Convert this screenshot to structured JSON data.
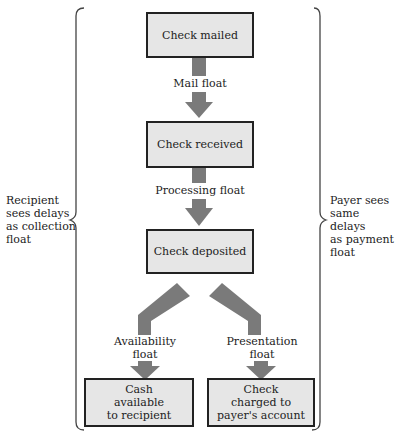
{
  "diagram": {
    "boxes": {
      "mailed": "Check mailed",
      "received": "Check received",
      "deposited": "Check deposited",
      "cash_line1": "Cash",
      "cash_line2": "available",
      "cash_line3": "to recipient",
      "charged_line1": "Check",
      "charged_line2": "charged to",
      "charged_line3": "payer's account"
    },
    "floats": {
      "mail": "Mail float",
      "processing": "Processing float",
      "availability_line1": "Availability",
      "availability_line2": "float",
      "presentation_line1": "Presentation",
      "presentation_line2": "float"
    },
    "sides": {
      "left": [
        "Recipient",
        "sees delays",
        "as collection",
        "float"
      ],
      "right": [
        "Payer sees",
        "same delays",
        "as payment",
        "float"
      ]
    },
    "colors": {
      "box_fill": "#e6e6e6",
      "arrow": "#7a7a7a",
      "border": "#222222"
    }
  }
}
